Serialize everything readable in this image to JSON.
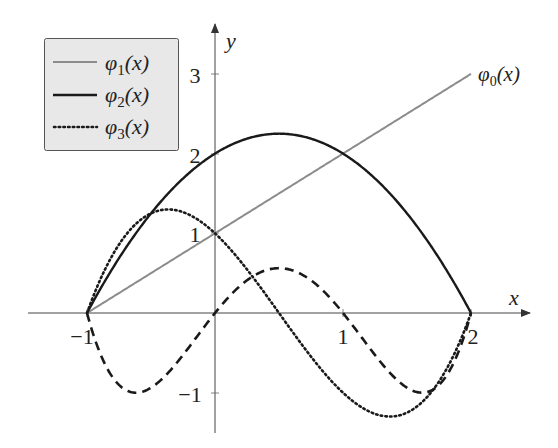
{
  "chart_data": {
    "type": "line",
    "title": "",
    "xlabel": "x",
    "ylabel": "y",
    "xlim": [
      -1.5,
      2.45
    ],
    "ylim": [
      -1.5,
      3.6
    ],
    "x_ticks": [
      -1,
      1,
      2
    ],
    "x_tick_labels": [
      "−1",
      "1",
      "2"
    ],
    "y_ticks": [
      -1,
      1,
      2,
      3
    ],
    "y_tick_labels": [
      "−1",
      "1",
      "2",
      "3"
    ],
    "grid": false,
    "legend_position": "upper left",
    "legend": [
      "φ₁(x)",
      "φ₂(x)",
      "φ₃(x)"
    ],
    "annotations": [
      {
        "text": "φ₀(x)",
        "x": 2.0,
        "y": 3.0
      }
    ],
    "series": [
      {
        "name": "φ₀(x)",
        "style": "solid",
        "color": "#8c8c8c",
        "formula": "x+1",
        "x": [
          -1,
          0,
          1,
          2
        ],
        "values": [
          0,
          1,
          2,
          3
        ]
      },
      {
        "name": "φ₂(x)",
        "style": "solid",
        "color": "#1a1a1a",
        "formula": "(x+1)(2-x)",
        "x": [
          -1,
          -0.5,
          0,
          0.5,
          1,
          1.5,
          2
        ],
        "values": [
          0,
          1.25,
          2,
          2.25,
          2,
          1.25,
          0
        ]
      },
      {
        "name": "φ₃(x)",
        "style": "dotted",
        "color": "#1a1a1a",
        "formula": "0.5(x+1)(2-x)(1-2x)",
        "x": [
          -1,
          -0.5,
          0,
          0.5,
          1,
          1.5,
          2
        ],
        "values": [
          0,
          1.25,
          1,
          0,
          -1,
          -1.25,
          0
        ]
      },
      {
        "name": "dashed",
        "style": "dashed",
        "color": "#1a1a1a",
        "formula": "x(x+1)(x-1)(x-2)",
        "x": [
          -1,
          -0.5,
          0,
          0.5,
          1,
          1.5,
          2
        ],
        "values": [
          0,
          -0.94,
          0,
          0.56,
          0,
          -0.94,
          0
        ]
      }
    ]
  },
  "legend": {
    "items": [
      {
        "label": "φ",
        "sub": "1",
        "tail": "(x)"
      },
      {
        "label": "φ",
        "sub": "2",
        "tail": "(x)"
      },
      {
        "label": "φ",
        "sub": "3",
        "tail": "(x)"
      }
    ]
  },
  "axes": {
    "x_label": "x",
    "y_label": "y",
    "x_ticks": [
      "−1",
      "1",
      "2"
    ],
    "y_ticks": [
      "3",
      "2",
      "1",
      "−1"
    ]
  },
  "annotation": {
    "label": "φ",
    "sub": "0",
    "tail": "(x)"
  },
  "colors": {
    "gray_line": "#8c8c8c",
    "black": "#1a1a1a",
    "legend_fill": "#e8e8e8",
    "legend_border": "#555555"
  }
}
